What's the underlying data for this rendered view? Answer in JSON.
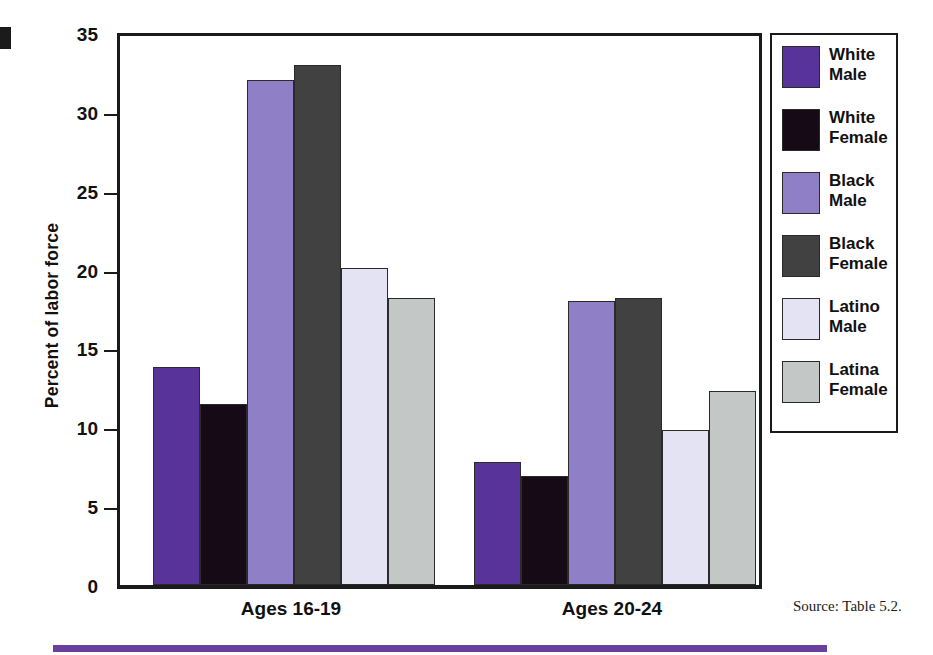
{
  "chart_data": {
    "type": "bar",
    "title": "",
    "xlabel": "",
    "ylabel": "Percent of labor force",
    "ylim": [
      0,
      35
    ],
    "yticks": [
      0,
      5,
      10,
      15,
      20,
      25,
      30,
      35
    ],
    "grid": false,
    "legend_position": "right",
    "categories": [
      "Ages 16-19",
      "Ages 20-24"
    ],
    "series": [
      {
        "name": "White Male",
        "color": "#58349a",
        "values": [
          13.8,
          7.8
        ]
      },
      {
        "name": "White Female",
        "color": "#150a15",
        "values": [
          11.5,
          6.9
        ]
      },
      {
        "name": "Black Male",
        "color": "#8e7fc6",
        "values": [
          32.0,
          18.0
        ]
      },
      {
        "name": "Black Female",
        "color": "#414141",
        "values": [
          33.0,
          18.2
        ]
      },
      {
        "name": "Latino Male",
        "color": "#e4e3f3",
        "values": [
          20.1,
          9.8
        ]
      },
      {
        "name": "Latina Female",
        "color": "#c3c7c5",
        "values": [
          18.2,
          12.3
        ]
      }
    ],
    "source_note": "Source: Table 5.2."
  },
  "legend": {
    "items": [
      {
        "line1": "White",
        "line2": "Male"
      },
      {
        "line1": "White",
        "line2": "Female"
      },
      {
        "line1": "Black",
        "line2": "Male"
      },
      {
        "line1": "Black",
        "line2": "Female"
      },
      {
        "line1": "Latino",
        "line2": "Male"
      },
      {
        "line1": "Latina",
        "line2": "Female"
      }
    ]
  }
}
